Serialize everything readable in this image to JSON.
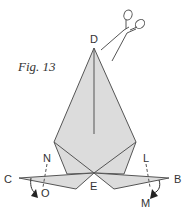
{
  "figure": {
    "caption": "Fig. 13",
    "colors": {
      "paper_fill": "#dcdcdc",
      "stroke": "#555555",
      "text": "#333333",
      "background": "#ffffff"
    },
    "points": {
      "D": "D",
      "C": "C",
      "B": "B",
      "E": "E",
      "N": "N",
      "O": "O",
      "L": "L",
      "M": "M"
    },
    "icons": [
      "scissors-icon",
      "fold-arrow-left-icon",
      "fold-arrow-right-icon"
    ]
  }
}
